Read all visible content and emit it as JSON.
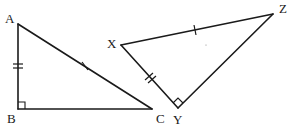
{
  "diagram": {
    "colors": {
      "stroke": "#1a1a1a",
      "background": "#ffffff"
    },
    "triangles": [
      {
        "name": "ABC",
        "vertices": {
          "A": {
            "label": "A",
            "x": 18,
            "y": 24
          },
          "B": {
            "label": "B",
            "x": 18,
            "y": 109
          },
          "C": {
            "label": "C",
            "x": 152,
            "y": 109
          }
        },
        "right_angle_at": "B",
        "markings": [
          {
            "side": "AB",
            "ticks": 2
          },
          {
            "side": "AC",
            "ticks": 1
          }
        ]
      },
      {
        "name": "XYZ",
        "vertices": {
          "X": {
            "label": "X",
            "x": 121,
            "y": 45
          },
          "Y": {
            "label": "Y",
            "x": 178,
            "y": 108
          },
          "Z": {
            "label": "Z",
            "x": 273,
            "y": 14
          }
        },
        "right_angle_at": "Y",
        "markings": [
          {
            "side": "XY",
            "ticks": 2
          },
          {
            "side": "XZ",
            "ticks": 1
          }
        ]
      }
    ],
    "labels": {
      "A": "A",
      "B": "B",
      "C": "C",
      "X": "X",
      "Y": "Y",
      "Z": "Z"
    }
  }
}
